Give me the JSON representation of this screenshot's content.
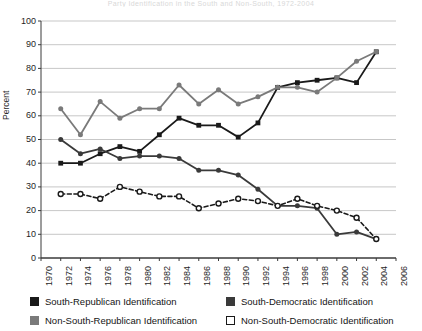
{
  "chart_data": {
    "type": "line",
    "title": "Party Identification in the South and Non-South, 1972-2004",
    "xlabel": "",
    "ylabel": "Percent",
    "ylim": [
      0,
      100
    ],
    "xlim": [
      1970,
      2006
    ],
    "ytick_step": 10,
    "xtick_step": 2,
    "grid": true,
    "legend_position": "bottom",
    "yticks": [
      100,
      90,
      80,
      70,
      60,
      50,
      40,
      30,
      20,
      10,
      0
    ],
    "xticks": [
      1970,
      1972,
      1974,
      1976,
      1978,
      1980,
      1982,
      1984,
      1986,
      1988,
      1990,
      1992,
      1994,
      1996,
      1998,
      2000,
      2002,
      2004,
      2006
    ],
    "x": [
      1972,
      1974,
      1976,
      1978,
      1980,
      1982,
      1984,
      1986,
      1988,
      1990,
      1992,
      1994,
      1996,
      1998,
      2000,
      2002,
      2004
    ],
    "series": [
      {
        "name": "South-Republican Identification",
        "key": "south_republican",
        "color": "#1a1a1a",
        "marker": "filled-square",
        "dash": "solid",
        "values": [
          40,
          40,
          44,
          47,
          45,
          52,
          59,
          56,
          56,
          51,
          57,
          72,
          74,
          75,
          76,
          74,
          87
        ]
      },
      {
        "name": "South-Democratic Identification",
        "key": "south_democratic",
        "color": "#3a3a3a",
        "marker": "filled-circle",
        "dash": "solid",
        "values": [
          50,
          44,
          46,
          42,
          43,
          43,
          42,
          37,
          37,
          35,
          29,
          22,
          22,
          21,
          10,
          11,
          8
        ]
      },
      {
        "name": "Non-South-Republican Identification",
        "key": "non_south_republican",
        "color": "#7a7a7a",
        "marker": "filled-circle",
        "dash": "solid",
        "values": [
          63,
          52,
          66,
          59,
          63,
          63,
          73,
          65,
          71,
          65,
          68,
          72,
          72,
          70,
          76,
          83,
          87
        ]
      },
      {
        "name": "Non-South-Democratic Identification",
        "key": "non_south_democratic",
        "color": "#1a1a1a",
        "marker": "open-circle",
        "dash": "dashed",
        "values": [
          27,
          27,
          25,
          30,
          28,
          26,
          26,
          21,
          23,
          25,
          24,
          22,
          25,
          22,
          20,
          17,
          8
        ]
      }
    ],
    "legend": [
      {
        "label": "South-Republican Identification",
        "swatch": "filled",
        "color": "#1a1a1a"
      },
      {
        "label": "South-Democratic Identification",
        "swatch": "filled",
        "color": "#3a3a3a"
      },
      {
        "label": "Non-South-Republican Identification",
        "swatch": "filled",
        "color": "#7a7a7a"
      },
      {
        "label": "Non-South-Democratic Identification",
        "swatch": "open",
        "color": "#ffffff"
      }
    ]
  }
}
